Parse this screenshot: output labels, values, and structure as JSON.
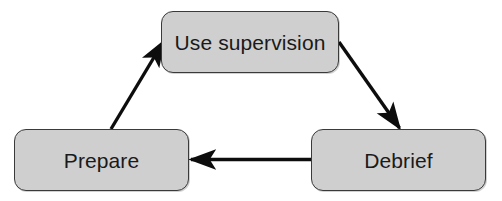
{
  "diagram": {
    "type": "cycle-flowchart",
    "background_color": "#ffffff",
    "node_fill_color": "#cfcfcf",
    "node_border_color": "#3a3a3a",
    "edge_color": "#0d0d0d",
    "text_color": "#1a1a1a",
    "nodes": [
      {
        "id": "use-supervision",
        "label": "Use supervision"
      },
      {
        "id": "prepare",
        "label": "Prepare"
      },
      {
        "id": "debrief",
        "label": "Debrief"
      }
    ],
    "edges": [
      {
        "from": "prepare",
        "to": "use-supervision",
        "direction": "up-right"
      },
      {
        "from": "use-supervision",
        "to": "debrief",
        "direction": "down-right"
      },
      {
        "from": "debrief",
        "to": "prepare",
        "direction": "left"
      }
    ]
  }
}
